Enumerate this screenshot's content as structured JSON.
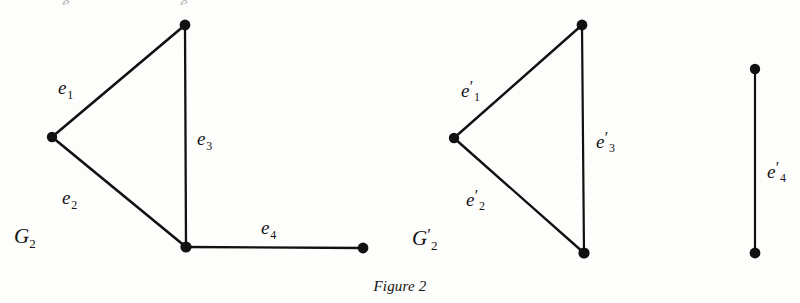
{
  "figure": {
    "caption": "Figure 2",
    "background_color": "#fdfdfc",
    "ink_color": "#111111",
    "width": 800,
    "height": 303
  },
  "graphs": [
    {
      "name": "G2",
      "label_base": "G",
      "label_sub": "2",
      "label_prime": "",
      "label_pos": {
        "x": 14,
        "y": 226
      },
      "vertices": [
        {
          "id": "v-left",
          "x": 52,
          "y": 137,
          "r": 5.2
        },
        {
          "id": "v-top",
          "x": 185,
          "y": 25,
          "r": 5.4
        },
        {
          "id": "v-bottom",
          "x": 186,
          "y": 247,
          "r": 5.6
        },
        {
          "id": "v-right",
          "x": 363,
          "y": 248,
          "r": 5.4
        }
      ],
      "edges": [
        {
          "id": "e1",
          "from": "v-left",
          "to": "v-top",
          "label_base": "e",
          "label_sub": "1",
          "label_prime": "",
          "label_pos": {
            "x": 58,
            "y": 78
          }
        },
        {
          "id": "e2",
          "from": "v-left",
          "to": "v-bottom",
          "label_base": "e",
          "label_sub": "2",
          "label_prime": "",
          "label_pos": {
            "x": 62,
            "y": 188
          }
        },
        {
          "id": "e3",
          "from": "v-top",
          "to": "v-bottom",
          "label_base": "e",
          "label_sub": "3",
          "label_prime": "",
          "label_pos": {
            "x": 197,
            "y": 129
          }
        },
        {
          "id": "e4",
          "from": "v-bottom",
          "to": "v-right",
          "label_base": "e",
          "label_sub": "4",
          "label_prime": "",
          "label_pos": {
            "x": 261,
            "y": 218
          }
        }
      ]
    },
    {
      "name": "G2-prime",
      "label_base": "G",
      "label_sub": "2",
      "label_prime": "′",
      "label_pos": {
        "x": 412,
        "y": 226
      },
      "vertices": [
        {
          "id": "v-left",
          "x": 454,
          "y": 138,
          "r": 5.2
        },
        {
          "id": "v-top",
          "x": 582,
          "y": 25,
          "r": 5.4
        },
        {
          "id": "v-bottom",
          "x": 584,
          "y": 253,
          "r": 5.6
        },
        {
          "id": "v-iso-top",
          "x": 755,
          "y": 69,
          "r": 5.2
        },
        {
          "id": "v-iso-bottom",
          "x": 755,
          "y": 253,
          "r": 5.4
        }
      ],
      "edges": [
        {
          "id": "e1p",
          "from": "v-left",
          "to": "v-top",
          "label_base": "e",
          "label_sub": "1",
          "label_prime": "′",
          "label_pos": {
            "x": 461,
            "y": 79
          }
        },
        {
          "id": "e2p",
          "from": "v-left",
          "to": "v-bottom",
          "label_base": "e",
          "label_sub": "2",
          "label_prime": "′",
          "label_pos": {
            "x": 466,
            "y": 188
          }
        },
        {
          "id": "e3p",
          "from": "v-top",
          "to": "v-bottom",
          "label_base": "e",
          "label_sub": "3",
          "label_prime": "′",
          "label_pos": {
            "x": 596,
            "y": 130
          }
        },
        {
          "id": "e4p",
          "from": "v-iso-top",
          "to": "v-iso-bottom",
          "label_base": "e",
          "label_sub": "4",
          "label_prime": "′",
          "label_pos": {
            "x": 767,
            "y": 160
          }
        }
      ]
    }
  ],
  "top_cut_text": [
    {
      "text": "e",
      "x": 62,
      "y": 0
    },
    {
      "text": "e",
      "x": 180,
      "y": 0
    }
  ]
}
